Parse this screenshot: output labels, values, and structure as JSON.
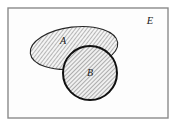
{
  "figure": {
    "type": "venn-diagram",
    "background_color": "#ffffff",
    "universe": {
      "label": "E",
      "label_x": 150,
      "label_y": 24,
      "rect": {
        "x": 8,
        "y": 8,
        "width": 160,
        "height": 110
      },
      "border_color": "#8a8a8a",
      "border_width": 1.4,
      "fill_color": "#fdfdfd"
    },
    "sets": [
      {
        "name": "A",
        "shape": "ellipse",
        "label": "A",
        "label_x": 63,
        "label_y": 44,
        "cx": 74,
        "cy": 48,
        "rx": 44,
        "ry": 21,
        "rotation_deg": -7,
        "stroke_color": "#262626",
        "stroke_width": 1.1,
        "fill": "hatch"
      },
      {
        "name": "B",
        "shape": "circle",
        "label": "B",
        "label_x": 90,
        "label_y": 76,
        "cx": 90,
        "cy": 73,
        "r": 27,
        "stroke_color": "#111111",
        "stroke_width": 2.0,
        "fill": "hatch"
      }
    ],
    "hatch": {
      "angle_deg": 45,
      "line_color": "#4d4d4d",
      "line_width": 0.7,
      "spacing": 3,
      "background": "#f2f2f2"
    }
  }
}
